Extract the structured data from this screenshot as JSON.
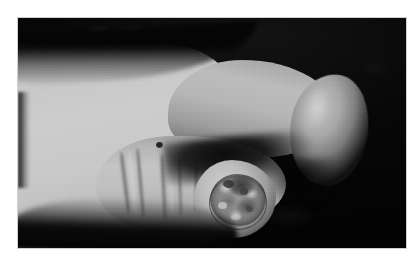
{
  "page": {
    "background_color": "#ffffff",
    "width": 418,
    "height": 272,
    "caption": ""
  },
  "photo": {
    "type": "clinical-photograph",
    "subject": "hand",
    "color_mode": "grayscale",
    "background_color": "#050505",
    "frame": {
      "left": 18,
      "top": 18,
      "width": 388,
      "height": 230
    },
    "regions": [
      {
        "name": "hand-dorsum",
        "label": ""
      },
      {
        "name": "thumb",
        "label": ""
      },
      {
        "name": "index-finger",
        "label": ""
      },
      {
        "name": "thumb-tip-lesion",
        "label": ""
      },
      {
        "name": "nevus",
        "label": ""
      }
    ],
    "tones": {
      "skin_highlight": "#cdcdcd",
      "skin_midtone": "#b4b4b4",
      "skin_shadow": "#8f8f8f",
      "background": "#050505",
      "lesion_dark": "#3d3d3d",
      "lesion_light": "#d4d4d4"
    }
  }
}
